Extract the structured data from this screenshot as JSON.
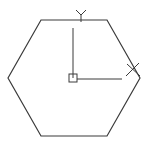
{
  "drawing": {
    "background": "#ffffff",
    "stroke_color": "#3a3a3a",
    "hexagon": {
      "points": "41,20 107,20 140,78 107,136 41,136 8,78"
    },
    "ucs_icon": {
      "origin": {
        "x": 73,
        "y": 78
      },
      "y_axis": {
        "x1": 73,
        "y1": 28,
        "x2": 73,
        "y2": 78,
        "label": "Y"
      },
      "x_axis": {
        "x1": 77,
        "y1": 79,
        "x2": 122,
        "y2": 79,
        "label": "X"
      },
      "origin_box": {
        "x": 69,
        "y": 74,
        "size": 8
      }
    }
  }
}
